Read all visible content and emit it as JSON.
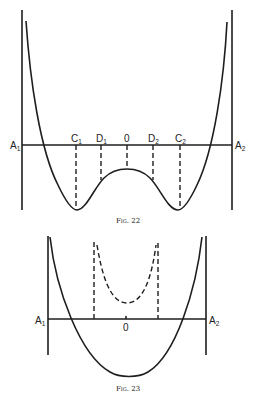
{
  "figures": [
    {
      "id": "fig22",
      "caption": "Fig. 22",
      "axis_labels": {
        "left": "A",
        "left_sub": "1",
        "right": "A",
        "right_sub": "2"
      },
      "point_labels": [
        {
          "name": "C",
          "sub": "1"
        },
        {
          "name": "D",
          "sub": "1"
        },
        {
          "name": "0",
          "sub": ""
        },
        {
          "name": "D",
          "sub": "2"
        },
        {
          "name": "C",
          "sub": "2"
        }
      ],
      "description": "Double-well (W-shaped) curve between two vertical walls; dashed verticals at C1, D1, 0, D2, C2"
    },
    {
      "id": "fig23",
      "caption": "Fig. 23",
      "axis_labels": {
        "left": "A",
        "left_sub": "1",
        "right": "A",
        "right_sub": "2"
      },
      "point_labels": [
        {
          "name": "0",
          "sub": ""
        }
      ],
      "description": "Single-well parabola between two vertical walls, with dashed curve above axis bounded by two dashed verticals"
    }
  ]
}
